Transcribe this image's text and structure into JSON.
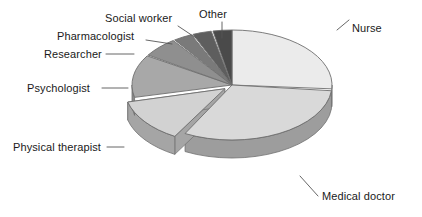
{
  "chart_data": {
    "type": "pie",
    "title": "",
    "subtitle": "",
    "xlabel": "",
    "ylabel": "",
    "legend_position": "none",
    "grid": false,
    "style": "3d-exploded-pie",
    "start_angle_deg": 0,
    "direction": "clockwise",
    "categories": [
      "Nurse",
      "Medical doctor",
      "Physical therapist",
      "Psychologist",
      "Researcher",
      "Pharmacologist",
      "Social worker",
      "Other"
    ],
    "values": [
      26,
      31,
      13,
      13,
      6,
      3,
      3,
      5
    ],
    "unit": "percent",
    "slices": [
      {
        "label": "Nurse",
        "value": 26,
        "color": "#ebebeb",
        "side_color": "#c9c9c9",
        "exploded": false,
        "start_deg": 0,
        "end_deg": 94
      },
      {
        "label": "Medical doctor",
        "value": 31,
        "color": "#d9d9d9",
        "side_color": "#9d9d9d",
        "exploded": false,
        "start_deg": 96,
        "end_deg": 208
      },
      {
        "label": "Physical therapist",
        "value": 13,
        "color": "#d2d2d2",
        "side_color": "#a5a5a5",
        "exploded": true,
        "start_deg": 210,
        "end_deg": 256
      },
      {
        "label": "Psychologist",
        "value": 13,
        "color": "#a8a8a8",
        "side_color": "#8a8a8a",
        "exploded": false,
        "start_deg": 257,
        "end_deg": 302
      },
      {
        "label": "Researcher",
        "value": 6,
        "color": "#8f8f8f",
        "side_color": "#737373",
        "exploded": false,
        "start_deg": 303,
        "end_deg": 324
      },
      {
        "label": "Pharmacologist",
        "value": 3,
        "color": "#7a7a7a",
        "side_color": "#636363",
        "exploded": false,
        "start_deg": 325,
        "end_deg": 336
      },
      {
        "label": "Social worker",
        "value": 3,
        "color": "#5e5e5e",
        "side_color": "#4d4d4d",
        "exploded": false,
        "start_deg": 337,
        "end_deg": 348
      },
      {
        "label": "Other",
        "value": 5,
        "color": "#4a4a4a",
        "side_color": "#3b3b3b",
        "exploded": false,
        "start_deg": 349,
        "end_deg": 360
      }
    ]
  },
  "labels": {
    "nurse": "Nurse",
    "medical_doctor": "Medical doctor",
    "physical_therapist": "Physical therapist",
    "psychologist": "Psychologist",
    "researcher": "Researcher",
    "pharmacologist": "Pharmacologist",
    "social_worker": "Social worker",
    "other": "Other"
  },
  "colors": {
    "background": "#ffffff",
    "text": "#1a1a1a",
    "leader_line": "#565656",
    "outline": "#6e6e6e"
  }
}
